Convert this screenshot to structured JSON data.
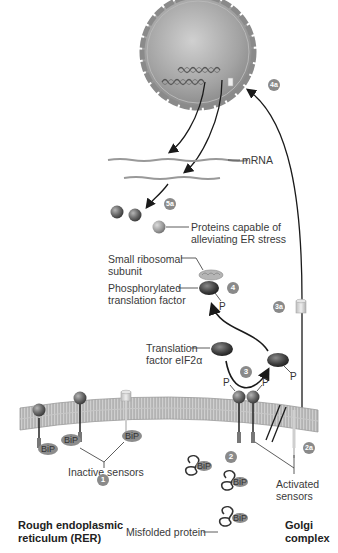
{
  "labels": {
    "mrna": "mRNA",
    "proteins_stress_line1": "Proteins capable of",
    "proteins_stress_line2": "alleviating ER stress",
    "small_ribosomal_line1": "Small ribosomal",
    "small_ribosomal_line2": "subunit",
    "phosphorylated_line1": "Phosphorylated",
    "phosphorylated_line2": "translation factor",
    "translation_factor_line1": "Translation",
    "translation_factor_line2": "factor eIF2α",
    "inactive_sensors": "Inactive sensors",
    "activated_sensors_line1": "Activated",
    "activated_sensors_line2": "sensors",
    "misfolded_protein": "Misfolded protein",
    "rer_line1": "Rough endoplasmic",
    "rer_line2": "reticulum (RER)",
    "golgi_line1": "Golgi",
    "golgi_line2": "complex",
    "phosphate": "P",
    "bip": "BiP"
  },
  "steps": {
    "s1": "1",
    "s2": "2",
    "s2a": "2a",
    "s3": "3",
    "s3a": "3a",
    "s4": "4",
    "s4a": "4a",
    "s5a": "5a"
  },
  "colors": {
    "nucleus": "#9a9a9a",
    "membrane": "#a8a8a8",
    "sphere": "#6e6e6e",
    "bip": "#8c8c8c",
    "badge": "#8a8a8a",
    "arrow": "#1a1a1a"
  }
}
